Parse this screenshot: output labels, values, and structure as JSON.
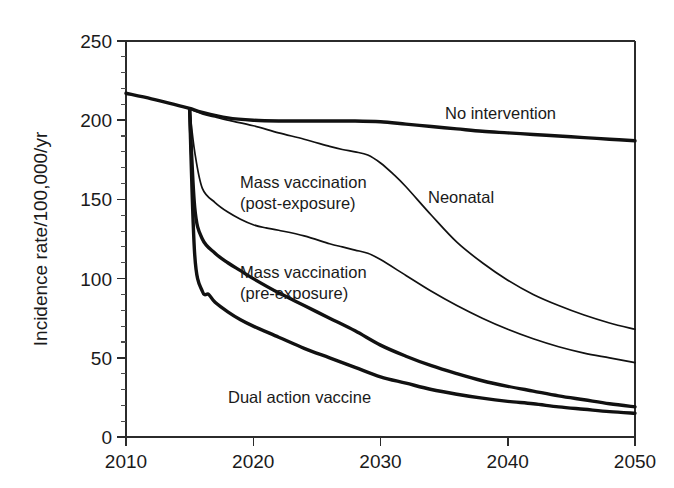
{
  "chart_data": {
    "type": "line",
    "title": "",
    "xlabel": "",
    "ylabel": "Incidence rate/100,000/yr",
    "xlim": [
      2010,
      2050
    ],
    "ylim": [
      0,
      250
    ],
    "xticks": [
      2010,
      2020,
      2030,
      2040,
      2050
    ],
    "xticklabels": [
      "2010",
      "2020",
      "2030",
      "2040",
      "2050"
    ],
    "yticks": [
      0,
      50,
      100,
      150,
      200,
      250
    ],
    "yticklabels": [
      "0",
      "50",
      "100",
      "150",
      "200",
      "250"
    ],
    "y_minor_tick_step": 10,
    "grid": false,
    "legend_position": "inline-annotations",
    "line_color": "#111111",
    "background": "#ffffff",
    "series": [
      {
        "name": "No intervention",
        "style": "thick",
        "label_x": 2042,
        "label_y": 208,
        "x": [
          2010,
          2012,
          2014,
          2015,
          2016,
          2018,
          2020,
          2022,
          2024,
          2026,
          2028,
          2030,
          2032,
          2034,
          2036,
          2038,
          2040,
          2042,
          2044,
          2046,
          2048,
          2050
        ],
        "y": [
          217,
          213.5,
          209.5,
          207.5,
          205,
          201.5,
          200,
          199.5,
          199.5,
          199.5,
          199.5,
          199,
          197.5,
          196,
          194.5,
          193,
          192,
          191,
          190,
          189,
          188,
          187
        ]
      },
      {
        "name": "Neonatal",
        "style": "thin",
        "label_x": 2033,
        "label_y": 157,
        "x": [
          2015,
          2016,
          2017,
          2018,
          2020,
          2022,
          2024,
          2026,
          2027,
          2028,
          2029,
          2030,
          2031,
          2032,
          2034,
          2036,
          2038,
          2040,
          2042,
          2044,
          2046,
          2048,
          2050
        ],
        "y": [
          207,
          204,
          202,
          200,
          196.5,
          192,
          188,
          183.5,
          181.5,
          180,
          178,
          173,
          166,
          158,
          140,
          123,
          110,
          99,
          90,
          83,
          77,
          72,
          68
        ]
      },
      {
        "name": "Mass vaccination (post-exposure)",
        "style": "thin",
        "label_x": 2023,
        "label_y": 162,
        "x": [
          2015,
          2015.4,
          2016,
          2017,
          2018,
          2019,
          2020,
          2021,
          2022,
          2024,
          2026,
          2027,
          2028,
          2029,
          2030,
          2032,
          2034,
          2036,
          2038,
          2040,
          2042,
          2044,
          2046,
          2048,
          2050
        ],
        "y": [
          207,
          180,
          157,
          148,
          142,
          137.5,
          134,
          132,
          130.5,
          127,
          122,
          120,
          118,
          116,
          112,
          102,
          92,
          83,
          75,
          68,
          62,
          57,
          53,
          50,
          47
        ]
      },
      {
        "name": "Mass vaccination (pre-exposure)",
        "style": "thick",
        "label_x": 2023,
        "label_y": 106,
        "x": [
          2015,
          2015.4,
          2016,
          2017,
          2018,
          2019,
          2020,
          2022,
          2024,
          2026,
          2028,
          2030,
          2032,
          2034,
          2036,
          2038,
          2040,
          2042,
          2044,
          2046,
          2048,
          2050
        ],
        "y": [
          207,
          145,
          125,
          116,
          110,
          105,
          100,
          91,
          83,
          75,
          67,
          58,
          51,
          45,
          40,
          35.5,
          32,
          29,
          26,
          23.5,
          21,
          19
        ]
      },
      {
        "name": "Dual action vaccine",
        "style": "thick",
        "label_x": 2022,
        "label_y": 28,
        "x": [
          2015,
          2015.4,
          2016,
          2016.5,
          2017,
          2018,
          2019,
          2020,
          2022,
          2024,
          2026,
          2028,
          2030,
          2032,
          2034,
          2036,
          2038,
          2040,
          2042,
          2044,
          2046,
          2048,
          2050
        ],
        "y": [
          207,
          115,
          92,
          90,
          85,
          79,
          74,
          70,
          63,
          56,
          50,
          44,
          38,
          34,
          30,
          27,
          24.5,
          22.5,
          21,
          19,
          17.5,
          16,
          15
        ]
      }
    ],
    "annotations": [
      {
        "text": "No intervention",
        "x": 445,
        "y": 119,
        "anchor": "start"
      },
      {
        "text": "Neonatal",
        "x": 428,
        "y": 203,
        "anchor": "start"
      },
      {
        "text": "Mass vaccination",
        "x": 240,
        "y": 188,
        "anchor": "start"
      },
      {
        "text": "(post-exposure)",
        "x": 240,
        "y": 209,
        "anchor": "start"
      },
      {
        "text": "Mass vaccination",
        "x": 240,
        "y": 278,
        "anchor": "start"
      },
      {
        "text": "(pre-exposure)",
        "x": 240,
        "y": 299,
        "anchor": "start"
      },
      {
        "text": "Dual action vaccine",
        "x": 228,
        "y": 403,
        "anchor": "start"
      }
    ]
  }
}
